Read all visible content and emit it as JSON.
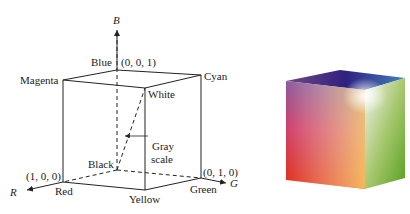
{
  "diagram": {
    "axes": {
      "r": "R",
      "g": "G",
      "b": "B"
    },
    "vertices": {
      "blue": "Blue",
      "blue_coord": "(0, 0, 1)",
      "magenta": "Magenta",
      "cyan": "Cyan",
      "white": "White",
      "black": "Black",
      "red": "Red",
      "red_coord": "(1, 0, 0)",
      "yellow": "Yellow",
      "green": "Green",
      "green_coord": "(0, 1, 0)"
    },
    "grayscale": {
      "line1": "Gray",
      "line2": "scale"
    }
  },
  "cube_image": {
    "description": "RGB color cube rendering"
  }
}
